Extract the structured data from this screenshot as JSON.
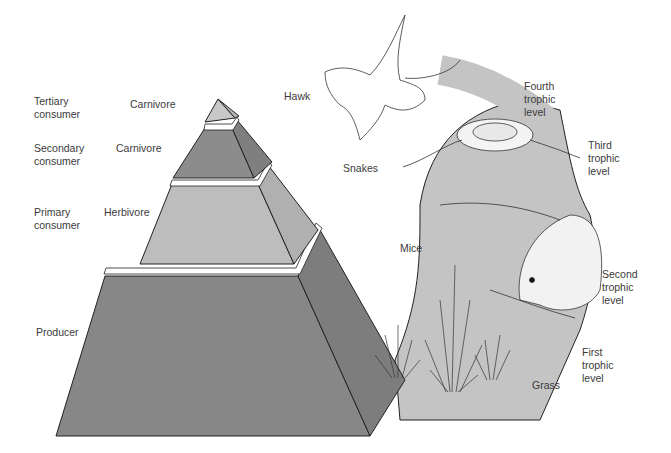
{
  "pyramid": {
    "levels": [
      {
        "consumer": "Tertiary\nconsumer",
        "role": "Carnivore",
        "consumer_lines": [
          "Tertiary",
          "consumer"
        ]
      },
      {
        "consumer": "Secondary\nconsumer",
        "role": "Carnivore",
        "consumer_lines": [
          "Secondary",
          "consumer"
        ]
      },
      {
        "consumer": "Primary\nconsumer",
        "role": "Herbivore",
        "consumer_lines": [
          "Primary",
          "consumer"
        ]
      },
      {
        "consumer": "Producer",
        "role": "",
        "consumer_lines": [
          "Producer"
        ]
      }
    ],
    "colors": {
      "top": "#c8c8c8",
      "second": "#8c8c8c",
      "third": "#bdbdbd",
      "bottom": "#878787",
      "side_dark": "#7a7a7a",
      "side_light": "#b0b0b0"
    }
  },
  "organisms": {
    "hawk": "Hawk",
    "snakes": "Snakes",
    "mice": "Mice",
    "grass": "Grass"
  },
  "trophic_levels": [
    {
      "lines": [
        "Fourth",
        "trophic",
        "level"
      ]
    },
    {
      "lines": [
        "Third",
        "trophic",
        "level"
      ]
    },
    {
      "lines": [
        "Second",
        "trophic",
        "level"
      ]
    },
    {
      "lines": [
        "First",
        "trophic",
        "level"
      ]
    }
  ],
  "band_color": "#c4c4c4"
}
